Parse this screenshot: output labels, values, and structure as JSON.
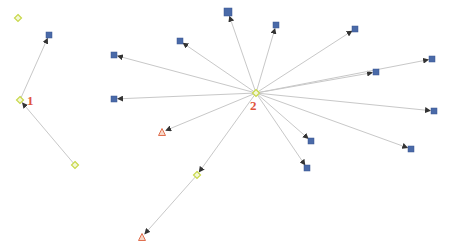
{
  "colors": {
    "edge": "#c8c8c8",
    "arrow": "#333333",
    "square": "#4a6aa8",
    "diamond_stroke": "#c8d84a",
    "diamond_fill": "#f4f8d8",
    "triangle_stroke": "#e07050",
    "triangle_fill": "#f8d8c8",
    "label": "#e0543c"
  },
  "labels": [
    {
      "id": "label-1",
      "text": "1",
      "x": 27,
      "y": 105
    },
    {
      "id": "label-2",
      "text": "2",
      "x": 250,
      "y": 110
    }
  ],
  "nodes": [
    {
      "id": "n-left-top",
      "shape": "diamond",
      "x": 18,
      "y": 18,
      "size": 6
    },
    {
      "id": "n-left-square",
      "shape": "square",
      "x": 49,
      "y": 35,
      "size": 6
    },
    {
      "id": "n1",
      "shape": "diamond",
      "x": 20,
      "y": 100,
      "size": 6
    },
    {
      "id": "n-left-bottom",
      "shape": "diamond",
      "x": 75,
      "y": 165,
      "size": 6
    },
    {
      "id": "n2",
      "shape": "diamond",
      "x": 256,
      "y": 93,
      "size": 6
    },
    {
      "id": "sq-a",
      "shape": "square",
      "x": 228,
      "y": 12,
      "size": 8
    },
    {
      "id": "sq-b",
      "shape": "square",
      "x": 180,
      "y": 41,
      "size": 6
    },
    {
      "id": "sq-c",
      "shape": "square",
      "x": 114,
      "y": 55,
      "size": 6
    },
    {
      "id": "sq-d",
      "shape": "square",
      "x": 114,
      "y": 99,
      "size": 6
    },
    {
      "id": "sq-e",
      "shape": "square",
      "x": 276,
      "y": 25,
      "size": 6
    },
    {
      "id": "sq-f",
      "shape": "square",
      "x": 355,
      "y": 29,
      "size": 6
    },
    {
      "id": "sq-g",
      "shape": "square",
      "x": 376,
      "y": 72,
      "size": 6
    },
    {
      "id": "sq-h",
      "shape": "square",
      "x": 432,
      "y": 59,
      "size": 6
    },
    {
      "id": "sq-i",
      "shape": "square",
      "x": 434,
      "y": 111,
      "size": 6
    },
    {
      "id": "sq-j",
      "shape": "square",
      "x": 311,
      "y": 141,
      "size": 6
    },
    {
      "id": "sq-k",
      "shape": "square",
      "x": 307,
      "y": 168,
      "size": 6
    },
    {
      "id": "sq-l",
      "shape": "square",
      "x": 411,
      "y": 149,
      "size": 6
    },
    {
      "id": "tri-a",
      "shape": "triangle",
      "x": 162,
      "y": 132,
      "size": 7
    },
    {
      "id": "tri-b",
      "shape": "triangle",
      "x": 142,
      "y": 237,
      "size": 7
    },
    {
      "id": "dm-mid",
      "shape": "diamond",
      "x": 197,
      "y": 175,
      "size": 6
    }
  ],
  "edges": [
    {
      "from": "n1",
      "to": "n-left-square",
      "x1": 20,
      "y1": 100,
      "x2": 49,
      "y2": 35
    },
    {
      "from": "n-left-bottom",
      "to": "n1",
      "x1": 75,
      "y1": 165,
      "x2": 20,
      "y2": 100
    },
    {
      "from": "n2",
      "to": "sq-a",
      "x1": 256,
      "y1": 93,
      "x2": 228,
      "y2": 12
    },
    {
      "from": "n2",
      "to": "sq-b",
      "x1": 256,
      "y1": 93,
      "x2": 180,
      "y2": 41
    },
    {
      "from": "n2",
      "to": "sq-c",
      "x1": 256,
      "y1": 93,
      "x2": 114,
      "y2": 55
    },
    {
      "from": "n2",
      "to": "sq-d",
      "x1": 256,
      "y1": 93,
      "x2": 114,
      "y2": 99
    },
    {
      "from": "n2",
      "to": "sq-e",
      "x1": 256,
      "y1": 93,
      "x2": 276,
      "y2": 25
    },
    {
      "from": "n2",
      "to": "sq-f",
      "x1": 256,
      "y1": 93,
      "x2": 355,
      "y2": 29
    },
    {
      "from": "n2",
      "to": "sq-g",
      "x1": 256,
      "y1": 93,
      "x2": 376,
      "y2": 72
    },
    {
      "from": "n2",
      "to": "sq-h",
      "x1": 256,
      "y1": 93,
      "x2": 432,
      "y2": 59
    },
    {
      "from": "n2",
      "to": "sq-i",
      "x1": 256,
      "y1": 93,
      "x2": 434,
      "y2": 111
    },
    {
      "from": "n2",
      "to": "sq-j",
      "x1": 256,
      "y1": 93,
      "x2": 311,
      "y2": 141
    },
    {
      "from": "n2",
      "to": "sq-k",
      "x1": 256,
      "y1": 93,
      "x2": 307,
      "y2": 168
    },
    {
      "from": "n2",
      "to": "sq-l",
      "x1": 256,
      "y1": 93,
      "x2": 411,
      "y2": 149
    },
    {
      "from": "n2",
      "to": "tri-a",
      "x1": 256,
      "y1": 93,
      "x2": 162,
      "y2": 132
    },
    {
      "from": "n2",
      "to": "dm-mid",
      "x1": 256,
      "y1": 93,
      "x2": 197,
      "y2": 175
    },
    {
      "from": "dm-mid",
      "to": "tri-b",
      "x1": 197,
      "y1": 175,
      "x2": 142,
      "y2": 237
    }
  ]
}
